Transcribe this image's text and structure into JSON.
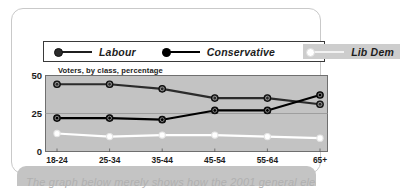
{
  "card": {
    "caption_text": "The graph below merely shows how the 2001 general election"
  },
  "legend": {
    "entries": [
      {
        "label": "Labour",
        "marker": "filled-dark-circle-icon",
        "color": "#2b2b2b",
        "highlighted": false
      },
      {
        "label": "Conservative",
        "marker": "filled-black-circle-icon",
        "color": "#000000",
        "highlighted": false
      },
      {
        "label": "Lib Dem",
        "marker": "open-white-circle-icon",
        "color": "#ffffff",
        "highlighted": true
      }
    ]
  },
  "chart_data": {
    "type": "line",
    "title": "",
    "axis_note": "Voters, by class, percentage",
    "xlabel": "",
    "xlabel_suffix": "years old",
    "ylabel": "",
    "ylim": [
      0,
      50
    ],
    "yticks": [
      0,
      25,
      50
    ],
    "grid": true,
    "legend_position": "top",
    "categories": [
      "18-24",
      "25-34",
      "35-44",
      "45-54",
      "55-64",
      "65+"
    ],
    "series": [
      {
        "name": "Labour",
        "color": "#2b2b2b",
        "values": [
          44,
          44,
          41,
          35,
          35,
          31
        ]
      },
      {
        "name": "Conservative",
        "color": "#000000",
        "values": [
          22,
          22,
          21,
          27,
          27,
          37
        ]
      },
      {
        "name": "Lib Dem",
        "color": "#ffffff",
        "values": [
          12,
          10,
          11,
          11,
          10,
          9
        ]
      }
    ]
  }
}
